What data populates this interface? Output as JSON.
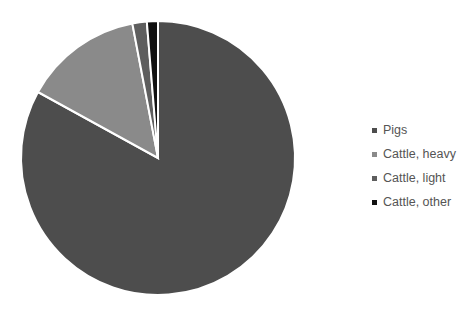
{
  "chart_data": {
    "type": "pie",
    "title": "",
    "categories": [
      "Pigs",
      "Cattle, heavy",
      "Cattle, light",
      "Cattle, other"
    ],
    "values": [
      83,
      14,
      1.7,
      1.3
    ],
    "colors": [
      "#4d4d4d",
      "#8a8a8a",
      "#5e5e5e",
      "#111111"
    ],
    "start_angle_deg": 0,
    "direction": "clockwise",
    "legend_position": "right"
  },
  "legend": {
    "items": [
      {
        "label": "Pigs",
        "color": "#4d4d4d"
      },
      {
        "label": "Cattle, heavy",
        "color": "#8a8a8a"
      },
      {
        "label": "Cattle, light",
        "color": "#5e5e5e"
      },
      {
        "label": "Cattle, other",
        "color": "#111111"
      }
    ]
  }
}
